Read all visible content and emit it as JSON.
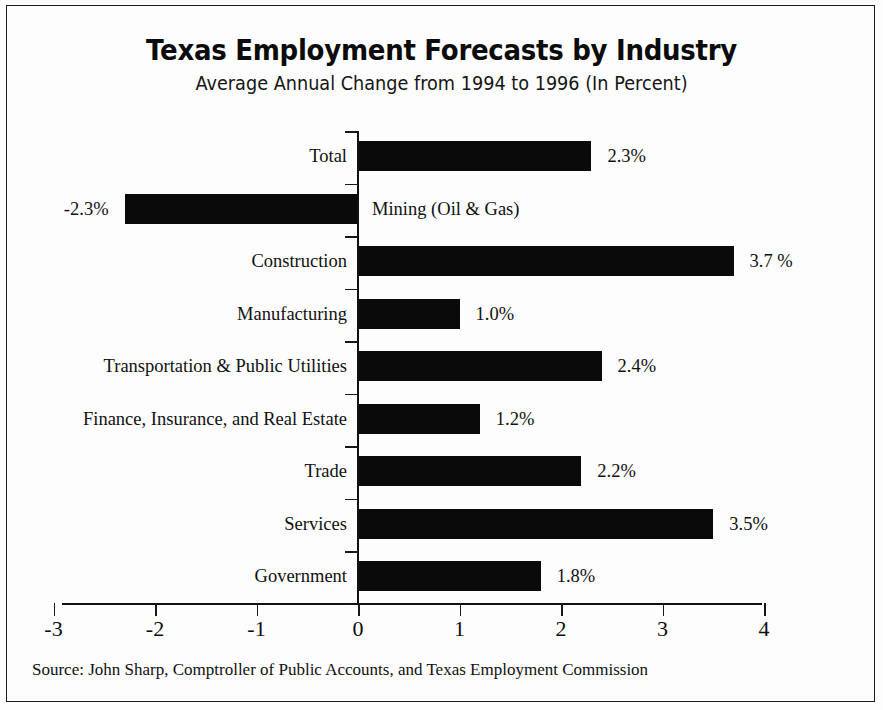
{
  "chart_data": {
    "type": "bar",
    "orientation": "horizontal",
    "title": "Texas Employment Forecasts by Industry",
    "subtitle": "Average Annual Change from 1994 to 1996 (In Percent)",
    "xlabel": "",
    "ylabel": "",
    "xlim": [
      -3,
      4
    ],
    "xticks": [
      "-3",
      "-2",
      "-1",
      "0",
      "1",
      "2",
      "3",
      "4"
    ],
    "xtick_values": [
      -3,
      -2,
      -1,
      0,
      1,
      2,
      3,
      4
    ],
    "grid": false,
    "legend": "none",
    "bar_color": "#0a0a0a",
    "categories": [
      "Total",
      "Mining (Oil & Gas)",
      "Construction",
      "Manufacturing",
      "Transportation & Public Utilities",
      "Finance, Insurance, and Real Estate",
      "Trade",
      "Services",
      "Government"
    ],
    "values": [
      2.3,
      -2.3,
      3.7,
      1.0,
      2.4,
      1.2,
      2.2,
      3.5,
      1.8
    ],
    "value_labels": [
      "2.3%",
      "-2.3%",
      "3.7 %",
      "1.0%",
      "2.4%",
      "1.2%",
      "2.2%",
      "3.5%",
      "1.8%"
    ],
    "source": "Source: John Sharp, Comptroller of Public Accounts, and Texas Employment Commission"
  }
}
